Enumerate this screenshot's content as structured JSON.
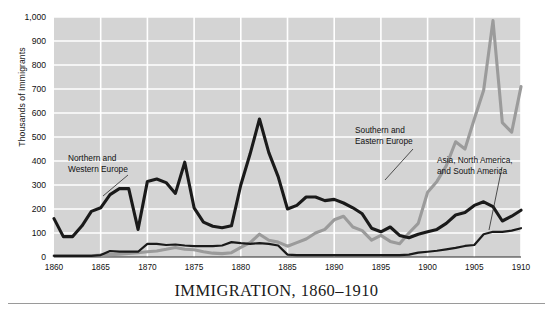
{
  "chart_data": {
    "type": "line",
    "title": "IMMIGRATION, 1860–1910",
    "xlabel": "",
    "ylabel": "Thousands of Immigrants",
    "xlim": [
      1860,
      1910
    ],
    "ylim": [
      0,
      1000
    ],
    "grid": true,
    "legend_position": "inline-annotations",
    "plot_bg": "#d4d4d4",
    "gridline_color": "#ffffff",
    "yticks": [
      0,
      100,
      200,
      300,
      400,
      500,
      600,
      700,
      800,
      900,
      1000
    ],
    "ytick_labels": [
      "0",
      "100",
      "200",
      "300",
      "400",
      "500",
      "600",
      "700",
      "800",
      "900",
      "1,000"
    ],
    "xticks": [
      1860,
      1865,
      1870,
      1875,
      1880,
      1885,
      1890,
      1895,
      1900,
      1905,
      1910
    ],
    "xtick_labels": [
      "1860",
      "1865",
      "1870",
      "1875",
      "1880",
      "1885",
      "1890",
      "1895",
      "1900",
      "1905",
      "1910"
    ],
    "x": [
      1860,
      1861,
      1862,
      1863,
      1864,
      1865,
      1866,
      1867,
      1868,
      1869,
      1870,
      1871,
      1872,
      1873,
      1874,
      1875,
      1876,
      1877,
      1878,
      1879,
      1880,
      1881,
      1882,
      1883,
      1884,
      1885,
      1886,
      1887,
      1888,
      1889,
      1890,
      1891,
      1892,
      1893,
      1894,
      1895,
      1896,
      1897,
      1898,
      1899,
      1900,
      1901,
      1902,
      1903,
      1904,
      1905,
      1906,
      1907,
      1908,
      1909,
      1910
    ],
    "series": [
      {
        "name": "Northern and Western Europe",
        "color": "#1a1a1a",
        "width": 3.1,
        "values": [
          160,
          85,
          85,
          130,
          190,
          205,
          260,
          285,
          285,
          115,
          315,
          325,
          310,
          265,
          395,
          205,
          145,
          128,
          122,
          130,
          300,
          430,
          575,
          435,
          335,
          200,
          215,
          250,
          250,
          235,
          240,
          225,
          205,
          180,
          120,
          105,
          125,
          90,
          80,
          95,
          105,
          115,
          140,
          175,
          185,
          215,
          230,
          210,
          150,
          170,
          195
        ]
      },
      {
        "name": "Southern and Eastern Europe",
        "color": "#9b9b9b",
        "width": 3.1,
        "values": [
          5,
          5,
          5,
          5,
          5,
          8,
          10,
          12,
          15,
          18,
          22,
          25,
          32,
          40,
          32,
          30,
          22,
          16,
          14,
          18,
          40,
          60,
          95,
          70,
          62,
          45,
          60,
          75,
          100,
          115,
          155,
          170,
          125,
          110,
          70,
          90,
          65,
          55,
          100,
          140,
          270,
          315,
          380,
          480,
          450,
          575,
          695,
          985,
          560,
          520,
          710
        ]
      },
      {
        "name": "Asia, North America, and South America",
        "color": "#1a1a1a",
        "width": 2.2,
        "values": [
          5,
          5,
          5,
          5,
          5,
          8,
          25,
          22,
          22,
          22,
          55,
          55,
          50,
          52,
          48,
          45,
          45,
          45,
          48,
          62,
          58,
          55,
          58,
          55,
          48,
          10,
          8,
          8,
          8,
          8,
          8,
          8,
          8,
          8,
          8,
          8,
          8,
          8,
          10,
          18,
          22,
          26,
          32,
          38,
          46,
          50,
          95,
          105,
          105,
          110,
          120
        ]
      }
    ],
    "annotations": [
      {
        "id": "annotation-northern-western-europe",
        "text": "Northern and\nWestern Europe"
      },
      {
        "id": "annotation-southern-eastern-europe",
        "text": "Southern and\nEastern Europe"
      },
      {
        "id": "annotation-asia-north-south-america",
        "text": "Asia, North America,\nand South America"
      }
    ]
  }
}
